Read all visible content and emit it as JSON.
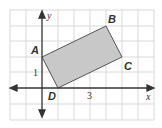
{
  "figure": {
    "axes": {
      "x_label": "x",
      "y_label": "y"
    },
    "tick_labels": {
      "x": "3",
      "y": "1"
    },
    "vertices": [
      {
        "name": "A",
        "x": 0,
        "y": 2
      },
      {
        "name": "B",
        "x": 4,
        "y": 4
      },
      {
        "name": "C",
        "x": 5,
        "y": 2
      },
      {
        "name": "D",
        "x": 1,
        "y": 0
      }
    ],
    "grid": {
      "x_min": -2,
      "x_max": 6,
      "y_min": -2,
      "y_max": 5
    },
    "colors": {
      "fill": "#c8c8c8",
      "stroke": "#555555",
      "grid": "#d8d8d8",
      "axis": "#333333"
    }
  }
}
